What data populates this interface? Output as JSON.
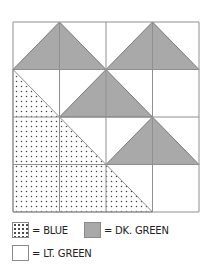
{
  "diagram": {
    "grid": {
      "rows": 4,
      "cols": 4,
      "left": 13,
      "top": 22,
      "right": 199,
      "bottom": 212
    },
    "colors": {
      "line": "#8f8f8f",
      "dark_green": "#a9a9a9",
      "light_green": "#ffffff",
      "blue_dots": "#444444"
    },
    "dark_green_triangles": [
      {
        "apex": [
          1,
          0
        ],
        "base": [
          [
            0,
            1
          ],
          [
            2,
            1
          ]
        ]
      },
      {
        "apex": [
          3,
          0
        ],
        "base": [
          [
            2,
            1
          ],
          [
            4,
            1
          ]
        ]
      },
      {
        "apex": [
          2,
          1
        ],
        "base": [
          [
            1,
            2
          ],
          [
            3,
            2
          ]
        ]
      },
      {
        "apex": [
          3,
          2
        ],
        "base": [
          [
            2,
            3
          ],
          [
            4,
            3
          ]
        ]
      }
    ],
    "blue_region": {
      "points": [
        [
          0,
          1
        ],
        [
          0,
          4
        ],
        [
          3,
          4
        ]
      ]
    }
  },
  "legend": {
    "items": [
      {
        "swatch": "blue",
        "label": "= BLUE"
      },
      {
        "swatch": "dk",
        "label": "= DK. GREEN"
      },
      {
        "swatch": "lt",
        "label": "= LT. GREEN"
      }
    ]
  }
}
